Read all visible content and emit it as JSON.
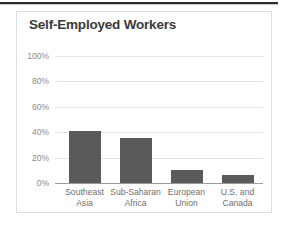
{
  "chart_data": {
    "type": "bar",
    "title": "Self-Employed Workers",
    "xlabel": "",
    "ylabel": "",
    "categories": [
      "Southeast\nAsia",
      "Sub-Saharan\nAfrica",
      "European\nUnion",
      "U.S. and\nCanada"
    ],
    "values": [
      41,
      35.5,
      10,
      6.5
    ],
    "ylim": [
      0,
      100
    ],
    "yticks": [
      0,
      20,
      40,
      60,
      80,
      100
    ],
    "ytick_labels": [
      "0%",
      "20%",
      "40%",
      "60%",
      "80%",
      "100%"
    ],
    "grid": true,
    "legend": null,
    "bar_color": "#5a5a5a",
    "gridline_color": "#e4e4e4",
    "axis_color": "#9c9c9c",
    "title_color": "#3a3a3a",
    "tick_label_color": "#8a8a8a",
    "category_label_color": "#6f6f6f"
  }
}
